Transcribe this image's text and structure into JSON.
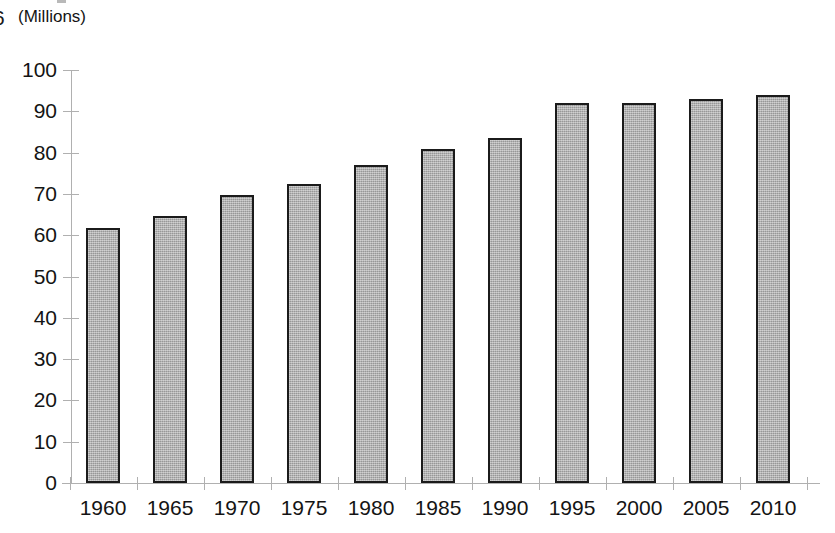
{
  "header": {
    "clipped_glyph": "6",
    "units_label": "(Millions)"
  },
  "chart_data": {
    "type": "bar",
    "title": "",
    "subtitle": "",
    "xlabel": "",
    "ylabel": "(Millions)",
    "categories": [
      "1960",
      "1965",
      "1970",
      "1975",
      "1980",
      "1985",
      "1990",
      "1995",
      "2000",
      "2005",
      "2010"
    ],
    "values": [
      61.8,
      64.7,
      69.7,
      72.5,
      77.0,
      80.8,
      83.6,
      92.0,
      92.0,
      93.0,
      94.0
    ],
    "ylim": [
      0,
      100
    ],
    "ytick_values": [
      0,
      10,
      20,
      30,
      40,
      50,
      60,
      70,
      80,
      90,
      100
    ],
    "ytick_labels": [
      "0",
      "10",
      "20",
      "30",
      "40",
      "50",
      "60",
      "70",
      "80",
      "90",
      "100"
    ],
    "grid": false,
    "legend": null,
    "bar_fill_color": "#a9a9a9",
    "bar_border_color": "#1b1b1b",
    "axis_color": "#b0b0b0",
    "text_color": "#141414",
    "background_color": "#ffffff"
  }
}
